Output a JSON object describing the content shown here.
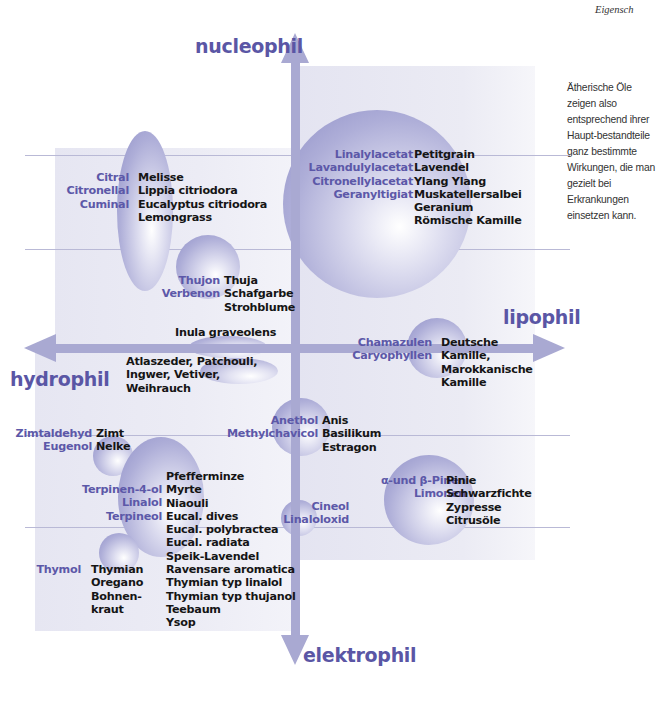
{
  "header": {
    "running_title": "Eigensch"
  },
  "sidenote": "Ätherische Öle zeigen also entsprechend ihrer Haupt-bestandteile ganz bestimmte Wirkungen, die man gezielt bei Erkrankungen einsetzen kann.",
  "axes": {
    "top": "nucleophil",
    "bottom": "elektrophil",
    "left": "hydrophil",
    "right": "lipophil"
  },
  "colors": {
    "axis": "#a9a9d2",
    "axis_label": "#5a56a5",
    "compound_text": "#5c58a8",
    "oil_text": "#151515",
    "panel": "#e8e8f3",
    "grid_line": "#b9b9d6"
  },
  "groups": [
    {
      "id": "citral",
      "quadrant": "hydrophil-nucleophil",
      "compounds": "Citral\nCitronellal\nCuminal",
      "oils": "Melisse\nLippia citriodora\nEucalyptus citriodora\nLemongrass"
    },
    {
      "id": "thujon",
      "quadrant": "hydrophil-nucleophil",
      "compounds": "Thujon\nVerbenon",
      "oils": "Thuja\nSchafgarbe\nStrohblume"
    },
    {
      "id": "ester",
      "quadrant": "lipophil-nucleophil",
      "compounds": "Linalylacetat\nLavandulylacetat\nCitronellylacetat\nGeranyltigiat",
      "oils": "Petitgrain\nLavendel\nYlang Ylang\nMuskatellersalbei\nGeranium\nRömische Kamille"
    },
    {
      "id": "inula",
      "quadrant": "axis",
      "compounds": "",
      "oils": "Inula graveolens"
    },
    {
      "id": "sesquiterpene",
      "quadrant": "axis",
      "compounds": "",
      "oils": "Atlaszeder, Patchouli,\nIngwer, Vetiver,\nWeihrauch"
    },
    {
      "id": "chamazulen",
      "quadrant": "axis-lipophil",
      "compounds": "Chamazulen\nCaryophyllen",
      "oils": "Deutsche\nKamille,\nMarokkanische\nKamille"
    },
    {
      "id": "zimt",
      "quadrant": "hydrophil-elektrophil",
      "compounds": "Zimtaldehyd\nEugenol",
      "oils": "Zimt\nNelke"
    },
    {
      "id": "anethol",
      "quadrant": "axis-elektrophil",
      "compounds": "Anethol\nMethylchavicol",
      "oils": "Anis\nBasilikum\nEstragon"
    },
    {
      "id": "terpineol",
      "quadrant": "hydrophil-elektrophil",
      "compounds": "Terpinen-4-ol\nLinalol\nTerpineol",
      "oils": "Pfefferminze\nMyrte\nNiaouli\nEucal. dives\nEucal. polybractea\nEucal. radiata\nSpeik-Lavendel\nRavensare aromatica\nThymian typ linalol\nThymian typ thujanol\nTeebaum\nYsop"
    },
    {
      "id": "cineol",
      "quadrant": "axis-elektrophil",
      "compounds": "Cineol\nLinaloloxid",
      "oils": ""
    },
    {
      "id": "pinen",
      "quadrant": "lipophil-elektrophil",
      "compounds": "α-und β-Pinen\nLimonen",
      "oils": "Pinie\nSchwarzfichte\nZypresse\nCitrusöle"
    },
    {
      "id": "thymol",
      "quadrant": "hydrophil-elektrophil",
      "compounds": "Thymol",
      "oils": "Thymian\nOregano\nBohnen-\nkraut"
    }
  ]
}
